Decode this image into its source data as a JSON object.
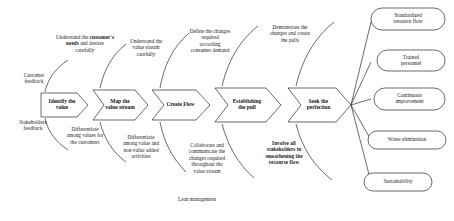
{
  "diagram": {
    "title_note": "Lean management",
    "steps": [
      {
        "id": "identify-value",
        "label": "Identify the\nvalue"
      },
      {
        "id": "map-value-stream",
        "label": "Map the\nvalue stream"
      },
      {
        "id": "create-flow",
        "label": "Create Flow"
      },
      {
        "id": "establishing-pull",
        "label": "Establishing\nthe pull"
      },
      {
        "id": "seek-perfection",
        "label": "Seek the\nperfection"
      }
    ],
    "inputs": [
      {
        "id": "customer-feedback",
        "label": "Customer\nfeedback"
      },
      {
        "id": "stakeholders-feedback",
        "label": "Stakeholders\nfeedback"
      }
    ],
    "top_annotations": [
      {
        "id": "understand-customer-needs",
        "pre": "Understand the",
        "bold": "customer's needs",
        "post": "and desires\ncarefully"
      },
      {
        "id": "understand-value-stream",
        "text": "Understand the\nvalue stream\ncarefully"
      },
      {
        "id": "define-changes",
        "text": "Define the changes\nrequired\naccording\nconsumer demand"
      },
      {
        "id": "demonstrate-changes",
        "text": "Demonstrate the\nchanges and create\nthe pulls"
      }
    ],
    "bottom_annotations": [
      {
        "id": "differentiate-values",
        "text": "Differentiate\namong values for\nthe customers"
      },
      {
        "id": "differentiate-value-added",
        "text": "Differentiate\namong value and\nnon-value added\nactivities"
      },
      {
        "id": "collaborate-communicate",
        "text": "Collaborate and\ncommunicate  the\nchanges required\nthroughout  the\nvalue stream"
      },
      {
        "id": "involve-stakeholders",
        "text": "Involve all\nstakeholders in\nsmoothening the\nrecourse flow"
      }
    ],
    "outcomes": [
      {
        "id": "standardized-resource-flow",
        "label": "Standardized\nresource flow"
      },
      {
        "id": "trained-personnel",
        "label": "Trained\npersonnel"
      },
      {
        "id": "continuous-improvement",
        "label": "Continuous\nimprovement"
      },
      {
        "id": "waste-elimination",
        "label": "Waste elimination"
      },
      {
        "id": "sustainability",
        "label": "Sustainability"
      }
    ],
    "colors": {
      "stroke": "#2b2b2b",
      "text": "#1a1a1a",
      "background": "#ffffff"
    }
  }
}
